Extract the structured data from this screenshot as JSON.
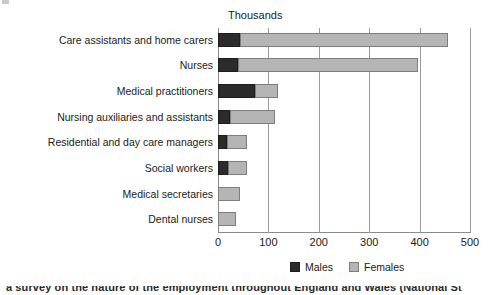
{
  "chart_data": {
    "type": "bar",
    "orientation": "horizontal",
    "stacked": true,
    "title": "",
    "unit_caption": "Thousands",
    "xlabel": "",
    "ylabel": "",
    "xlim": [
      0,
      500
    ],
    "xticks": [
      0,
      100,
      200,
      300,
      400,
      500
    ],
    "xtick_labels": [
      "0",
      "100",
      "200",
      "300",
      "400",
      "500"
    ],
    "grid": "vertical",
    "legend_position": "bottom-right",
    "categories": [
      "Care assistants and home carers",
      "Nurses",
      "Medical practitioners",
      "Nursing auxiliaries and assistants",
      "Residential and day care managers",
      "Social workers",
      "Medical secretaries",
      "Dental nurses"
    ],
    "series": [
      {
        "name": "Males",
        "color": "#2b2b2b",
        "values": [
          44,
          40,
          73,
          24,
          18,
          20,
          0,
          0
        ]
      },
      {
        "name": "Females",
        "color": "#b5b5b5",
        "values": [
          412,
          357,
          46,
          89,
          39,
          37,
          44,
          36
        ]
      }
    ],
    "totals": [
      456,
      397,
      119,
      113,
      57,
      57,
      44,
      36
    ]
  },
  "legend": {
    "items": [
      {
        "label": "Males",
        "swatch": "males-swatch"
      },
      {
        "label": "Females",
        "swatch": "females-swatch"
      }
    ]
  },
  "footer": {
    "text": "a survey on the nature of the employment throughout England and Wales (National St"
  }
}
